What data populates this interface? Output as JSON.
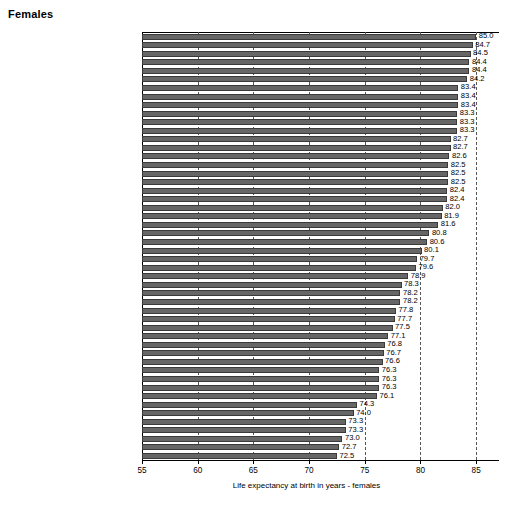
{
  "panel": {
    "title": "Females"
  },
  "chart_data": {
    "type": "bar",
    "orientation": "horizontal",
    "title": "Females",
    "xlabel": "Life expectancy at birth in years - females",
    "ylabel": "",
    "xlim": [
      55,
      87.05
    ],
    "xticks": [
      55,
      60,
      65,
      70,
      75,
      80,
      85
    ],
    "xticklabels": [
      "55",
      "60",
      "65",
      "70",
      "75",
      "80",
      "85"
    ],
    "grid": "vertical-dashed-at-xticks",
    "legend": "none",
    "bar_color": "#666666",
    "value_label_format": "one-decimal",
    "categories": [
      "France (2007)",
      "Spain (2008)",
      "Switzerland (2007)",
      "San Marino (2006)",
      "Italy (2007)",
      "Andorra (2006)",
      "Finland (2008)",
      "Austria (2008)",
      "Sweden (2008)",
      "Cyprus (2008)",
      "Norway (2008)",
      "Iceland (2008)",
      "Slovenia (2008)",
      "Ireland (2008)",
      "Netherlands (2008)",
      "Israel (2007)",
      "Greece (2008)",
      "Malta (2008)",
      "Germany (2006)",
      "Luxembourg (2007)",
      "Belgium (2004)",
      "United Kingdom (2007)",
      "Portugal (2004)",
      "Denmark (2006)",
      "Czech Republic (2008)",
      "Poland (2008)",
      "Croatia (2008)",
      "Estonia (2008)",
      "Albania (2004)",
      "Hungary (2008)",
      "Slovakia (2005)",
      "Montenegro (2008)",
      "Latvia (2008)",
      "Lithuania (2008)",
      "Romania (2009)",
      "Bulgaria (2008)",
      "Armenia (2008)",
      "Georgia (2005)",
      "Serbia (2008)",
      "Tajikistan (2005)",
      "Belarus (2007)",
      "Azerbaijan (2007)",
      "TFYR Macedonia (2003)",
      "Turkey (2008)",
      "Ukraine (2008)",
      "Republic of Moldova (2008)",
      "Russian Federation (2006)",
      "Uzbekistan (2005)",
      "Kyrgyzstan (2008)",
      "Kazakhstan (2008)"
    ],
    "values": [
      85.0,
      84.7,
      84.5,
      84.4,
      84.4,
      84.2,
      83.4,
      83.4,
      83.4,
      83.3,
      83.3,
      83.3,
      82.7,
      82.7,
      82.6,
      82.5,
      82.5,
      82.5,
      82.4,
      82.4,
      82.0,
      81.9,
      81.6,
      80.8,
      80.6,
      80.1,
      79.7,
      79.6,
      78.9,
      78.3,
      78.2,
      78.2,
      77.8,
      77.7,
      77.5,
      77.1,
      76.8,
      76.7,
      76.6,
      76.3,
      76.3,
      76.3,
      76.1,
      74.3,
      74.0,
      73.3,
      73.3,
      73.0,
      72.7,
      72.5
    ],
    "value_labels": [
      "85.0",
      "84.7",
      "84.5",
      "84.4",
      "84.4",
      "84.2",
      "83.4",
      "83.4",
      "83.4",
      "83.3",
      "83.3",
      "83.3",
      "82.7",
      "82.7",
      "82.6",
      "82.5",
      "82.5",
      "82.5",
      "82.4",
      "82.4",
      "82.0",
      "81.9",
      "81.6",
      "80.8",
      "80.6",
      "80.1",
      "79.7",
      "79.6",
      "78.9",
      "78.3",
      "78.2",
      "78.2",
      "77.8",
      "77.7",
      "77.5",
      "77.1",
      "76.8",
      "76.7",
      "76.6",
      "76.3",
      "76.3",
      "76.3",
      "76.1",
      "74.3",
      "74.0",
      "73.3",
      "73.3",
      "73.0",
      "72.7",
      "72.5"
    ]
  }
}
